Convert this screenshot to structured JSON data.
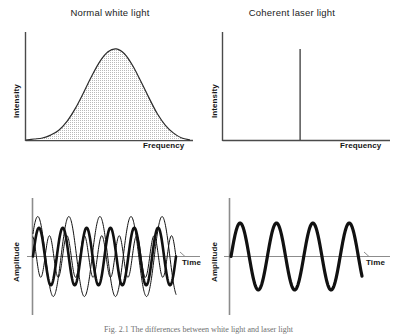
{
  "figure": {
    "caption": "Fig. 2.1  The differences between white light and laser light",
    "background_color": "#ffffff",
    "ink_color": "#1a1a1a"
  },
  "panels": [
    {
      "id": "normal-white-light-spectrum",
      "title": "Normal white light",
      "ylabel": "Intensity",
      "xlabel": "Frequency"
    },
    {
      "id": "coherent-laser-light-spectrum",
      "title": "Coherent laser light",
      "ylabel": "Intensity",
      "xlabel": "Frequency"
    },
    {
      "id": "normal-white-light-waveform",
      "title": "",
      "ylabel": "Amplitude",
      "xlabel": "Time"
    },
    {
      "id": "coherent-laser-light-waveform",
      "title": "",
      "ylabel": "Amplitude",
      "xlabel": "Time"
    }
  ],
  "chart_data": [
    {
      "type": "area",
      "title": "Normal white light",
      "xlabel": "Frequency",
      "ylabel": "Intensity",
      "grid": false,
      "legend": false,
      "xlim": [
        0,
        1
      ],
      "ylim": [
        0,
        1
      ],
      "fill": "#d9d9d9",
      "description": "Broad gaussian-shaped emission spectrum spanning a wide range of frequencies, shaded grey beneath the curve.",
      "x": [
        0.0,
        0.05,
        0.1,
        0.15,
        0.2,
        0.25,
        0.3,
        0.35,
        0.4,
        0.45,
        0.5,
        0.55,
        0.6,
        0.65,
        0.7,
        0.75,
        0.8,
        0.85,
        0.9,
        0.95,
        1.0
      ],
      "y": [
        0.0,
        0.01,
        0.02,
        0.05,
        0.1,
        0.19,
        0.32,
        0.48,
        0.65,
        0.8,
        0.9,
        0.93,
        0.88,
        0.76,
        0.6,
        0.43,
        0.27,
        0.15,
        0.07,
        0.02,
        0.0
      ]
    },
    {
      "type": "bar",
      "title": "Coherent laser light",
      "xlabel": "Frequency",
      "ylabel": "Intensity",
      "grid": false,
      "legend": false,
      "xlim": [
        0,
        1
      ],
      "ylim": [
        0,
        1
      ],
      "description": "A single narrow spectral line (monochromatic spike) at one frequency.",
      "categories": [
        "0.47"
      ],
      "values": [
        0.93
      ]
    },
    {
      "type": "line",
      "title": "Normal white light waveform",
      "xlabel": "Time",
      "ylabel": "Amplitude",
      "grid": false,
      "legend": false,
      "xlim": [
        0,
        1
      ],
      "ylim": [
        -1.15,
        1.15
      ],
      "description": "Three superimposed out-of-phase waves of differing amplitude, frequency and phase representing incoherent light.",
      "series": [
        {
          "name": "wave-thick",
          "amplitude": 0.72,
          "cycles": 6.0,
          "phase_deg": 0,
          "stroke_width": 2.6,
          "color": "#111111"
        },
        {
          "name": "wave-thin-large",
          "amplitude": 1.0,
          "cycles": 4.6,
          "phase_deg": 35,
          "stroke_width": 1.0,
          "color": "#111111"
        },
        {
          "name": "wave-thin-small",
          "amplitude": 0.52,
          "cycles": 8.2,
          "phase_deg": 110,
          "stroke_width": 1.0,
          "color": "#111111"
        }
      ]
    },
    {
      "type": "line",
      "title": "Coherent laser light waveform",
      "xlabel": "Time",
      "ylabel": "Amplitude",
      "grid": false,
      "legend": false,
      "xlim": [
        0,
        1
      ],
      "ylim": [
        -1.15,
        1.15
      ],
      "description": "A single clean sinusoid of constant amplitude and frequency representing coherent light.",
      "series": [
        {
          "name": "wave-coherent",
          "amplitude": 0.88,
          "cycles": 3.6,
          "phase_deg": 0,
          "stroke_width": 3.2,
          "color": "#111111"
        }
      ]
    }
  ]
}
